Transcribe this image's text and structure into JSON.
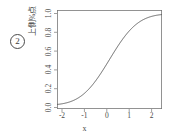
{
  "figure": {
    "marker_label": "2",
    "marker_name": "circled-number-two"
  },
  "chart_data": {
    "type": "line",
    "title": "",
    "subtitle": "",
    "xlabel": "x",
    "ylabel": "上側%点",
    "xlim": [
      -2.35,
      2.35
    ],
    "ylim": [
      -0.04,
      1.04
    ],
    "xticks": [
      -2,
      -1,
      0,
      1,
      2
    ],
    "xticklabels": [
      "-2",
      "-1",
      "0",
      "1",
      "2"
    ],
    "yticks": [
      0.0,
      0.2,
      0.4,
      0.6,
      0.8,
      1.0
    ],
    "yticklabels": [
      "0.0",
      "0.2",
      "0.4",
      "0.6",
      "0.8",
      "1.0"
    ],
    "grid": false,
    "legend": null,
    "line_color": "#555555",
    "box_color": "#777777",
    "series": [
      {
        "name": "normal cumulative distribution function",
        "x": [
          -2.35,
          -2.2,
          -2.0,
          -1.8,
          -1.6,
          -1.4,
          -1.2,
          -1.0,
          -0.8,
          -0.6,
          -0.4,
          -0.2,
          0.0,
          0.2,
          0.4,
          0.6,
          0.8,
          1.0,
          1.2,
          1.4,
          1.6,
          1.8,
          2.0,
          2.2,
          2.35
        ],
        "y": [
          0.009,
          0.014,
          0.023,
          0.036,
          0.055,
          0.081,
          0.115,
          0.159,
          0.212,
          0.274,
          0.345,
          0.421,
          0.5,
          0.579,
          0.655,
          0.726,
          0.788,
          0.841,
          0.885,
          0.919,
          0.945,
          0.964,
          0.977,
          0.986,
          0.991
        ]
      }
    ]
  }
}
